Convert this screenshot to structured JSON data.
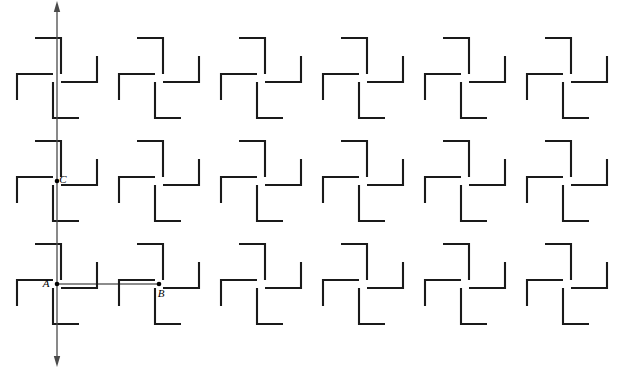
{
  "figure": {
    "title": "",
    "background_color": "#ffffff",
    "width": 626,
    "height": 369,
    "motif_color": "#1a1a1a",
    "axis_color": "#4a4a4a",
    "node_color": "#000000",
    "connector_color": "#1a1a1a"
  },
  "lattice": {
    "description": "periodic pinwheel motif lattice",
    "origin_x": 57,
    "origin_y": 284,
    "period_x": 102,
    "period_y": 103,
    "columns": 6,
    "rows": 3,
    "motif": {
      "name": "pinwheel-four-L",
      "fold_symmetry": 4,
      "arm_long": 36,
      "arm_short": 26,
      "gap": 4,
      "stroke_width": 2.1
    }
  },
  "axis": {
    "name": "vertical-axis",
    "x": 57,
    "y_top": 6,
    "y_bottom": 362,
    "arrow_top": true,
    "arrow_bottom": true
  },
  "points": [
    {
      "id": "A",
      "label": "A",
      "x": 57,
      "y": 284,
      "label_dx": -11,
      "label_dy": 3
    },
    {
      "id": "B",
      "label": "B",
      "x": 159,
      "y": 284,
      "label_dx": 2,
      "label_dy": 13
    },
    {
      "id": "C",
      "label": "C",
      "x": 57,
      "y": 181,
      "label_dx": 6,
      "label_dy": 2
    }
  ],
  "connectors": [
    {
      "id": "AB",
      "from": "A",
      "to": "B",
      "x1": 57,
      "y1": 284,
      "x2": 159,
      "y2": 284
    }
  ],
  "labels": {
    "a_label": "A",
    "b_label": "B",
    "c_label": "C"
  }
}
